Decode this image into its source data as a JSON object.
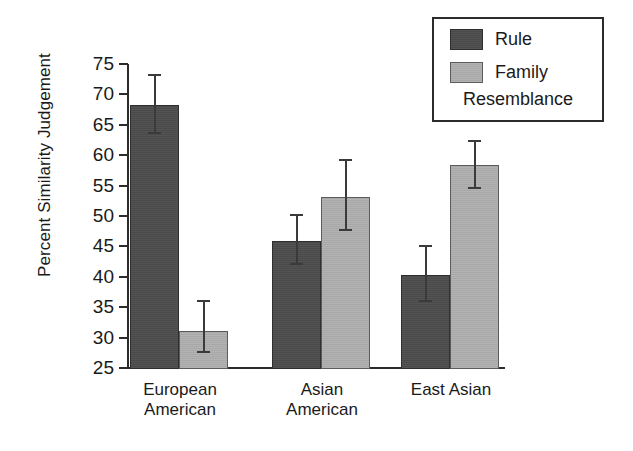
{
  "chart_data": {
    "type": "bar",
    "title": "",
    "xlabel": "",
    "ylabel": "Percent Similarity Judgement",
    "ylim": [
      25,
      75
    ],
    "ytick_step": 5,
    "yticks": [
      75,
      70,
      65,
      60,
      55,
      50,
      45,
      40,
      35,
      30,
      25
    ],
    "grid": false,
    "legend_position": "top-right",
    "categories": [
      "European\nAmerican",
      "Asian\nAmerican",
      "East Asian"
    ],
    "category_labels_flat": [
      "European American",
      "Asian American",
      "East Asian"
    ],
    "series": [
      {
        "name": "Rule",
        "color": "#4a4a4a",
        "values": [
          68.5,
          46.1,
          40.5
        ],
        "error_low": [
          63.5,
          42.0,
          35.9
        ],
        "error_high": [
          73.4,
          50.3,
          45.2
        ]
      },
      {
        "name": "Family Resemblance",
        "color": "#a8a8a8",
        "values": [
          31.3,
          53.3,
          58.5
        ],
        "error_low": [
          27.5,
          47.5,
          54.5
        ],
        "error_high": [
          36.2,
          59.3,
          62.5
        ]
      }
    ],
    "annotations": []
  },
  "legend": {
    "rule_label": "Rule",
    "family_label": "Family",
    "family_label_continued": "Resemblance"
  },
  "axis": {
    "y_title": "Percent Similarity Judgement"
  },
  "colors": {
    "rule": "#4a4a4a",
    "family": "#a8a8a8",
    "axis": "#2b2b2b",
    "text": "#1a1a1a",
    "background": "#ffffff"
  }
}
